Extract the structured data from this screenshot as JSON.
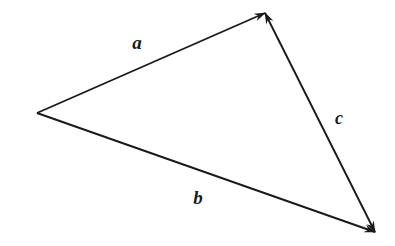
{
  "figure": {
    "background_color": "#ffffff",
    "stroke_color": "#1a1a1a",
    "width": 395,
    "height": 246
  },
  "vertices": {
    "left": {
      "name": "left-vertex",
      "x": 37,
      "y": 113
    },
    "apex": {
      "name": "top-apex-vertex",
      "x": 265,
      "y": 13
    },
    "bottom_right": {
      "name": "bottom-right-vertex",
      "x": 375,
      "y": 232
    }
  },
  "vectors": [
    {
      "id": "a",
      "label": "a",
      "from": "left",
      "to": "apex",
      "x1": 37,
      "y1": 113,
      "x2": 265,
      "y2": 13,
      "arrow_start": false,
      "arrow_end": true,
      "stroke_width": 1.9,
      "label_x": 137,
      "label_y": 42,
      "label_font_size": 19
    },
    {
      "id": "b",
      "label": "b",
      "from": "left",
      "to": "bottom_right",
      "x1": 37,
      "y1": 113,
      "x2": 375,
      "y2": 232,
      "arrow_start": false,
      "arrow_end": true,
      "stroke_width": 1.9,
      "label_x": 198,
      "label_y": 197,
      "label_font_size": 19
    },
    {
      "id": "c",
      "label": "c",
      "from": "bottom_right",
      "to": "apex",
      "x1": 375,
      "y1": 232,
      "x2": 265,
      "y2": 13,
      "arrow_start": true,
      "arrow_end": true,
      "stroke_width": 1.9,
      "label_x": 339,
      "label_y": 118,
      "label_font_size": 18
    }
  ]
}
